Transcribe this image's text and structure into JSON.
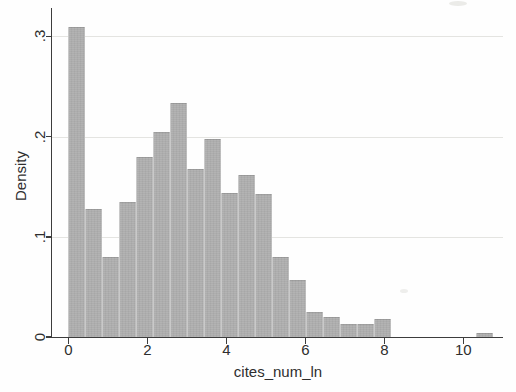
{
  "figure": {
    "background": "#fefefe"
  },
  "colors": {
    "bar_fill": "#adadad",
    "bar_edge_light": "#c9c9c9",
    "axis_line": "#3d3d3d",
    "grid_line": "#e4e4e1",
    "text": "#2e2e2e"
  },
  "chart_data": {
    "type": "bar",
    "subtype": "histogram",
    "title": "",
    "xlabel": "cites_num_ln",
    "ylabel": "Density",
    "x_ticks": [
      0,
      2,
      4,
      6,
      8,
      10
    ],
    "x_tick_labels": [
      "0",
      "2",
      "4",
      "6",
      "8",
      "10"
    ],
    "y_ticks": [
      0,
      0.1,
      0.2,
      0.3
    ],
    "y_tick_labels": [
      "0",
      ".1",
      ".2",
      ".3"
    ],
    "xlim": [
      -0.4,
      11.0
    ],
    "ylim": [
      0,
      0.326
    ],
    "grid": "horizontal-at-yticks",
    "legend": "none",
    "bin_width": 0.43,
    "bins": [
      {
        "start": 0.0,
        "density": 0.309
      },
      {
        "start": 0.43,
        "density": 0.128
      },
      {
        "start": 0.86,
        "density": 0.08
      },
      {
        "start": 1.29,
        "density": 0.135
      },
      {
        "start": 1.72,
        "density": 0.18
      },
      {
        "start": 2.15,
        "density": 0.205
      },
      {
        "start": 2.58,
        "density": 0.234
      },
      {
        "start": 3.01,
        "density": 0.168
      },
      {
        "start": 3.44,
        "density": 0.198
      },
      {
        "start": 3.87,
        "density": 0.144
      },
      {
        "start": 4.3,
        "density": 0.162
      },
      {
        "start": 4.73,
        "density": 0.143
      },
      {
        "start": 5.16,
        "density": 0.08
      },
      {
        "start": 5.59,
        "density": 0.057
      },
      {
        "start": 6.02,
        "density": 0.025
      },
      {
        "start": 6.45,
        "density": 0.02
      },
      {
        "start": 6.88,
        "density": 0.013
      },
      {
        "start": 7.31,
        "density": 0.013
      },
      {
        "start": 7.74,
        "density": 0.018
      },
      {
        "start": 10.32,
        "density": 0.004
      }
    ]
  }
}
